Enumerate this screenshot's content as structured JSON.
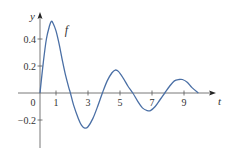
{
  "chart_data": {
    "type": "line",
    "title": "",
    "xlabel": "t",
    "ylabel": "y",
    "xlim": [
      -1.4,
      11.2
    ],
    "ylim": [
      -0.36,
      0.6
    ],
    "grid": false,
    "legend": null,
    "x_ticks": [
      1,
      3,
      5,
      7,
      9
    ],
    "x_tick_labels": [
      "1",
      "3",
      "5",
      "7",
      "9"
    ],
    "y_ticks": [
      0.4,
      0.2,
      -0.2
    ],
    "y_tick_labels": [
      "0.4",
      "0.2",
      "−0.2"
    ],
    "origin_label": "0",
    "series": [
      {
        "name": "f",
        "color": "#4a6fa5",
        "x": [
          0,
          0.2,
          0.4,
          0.6,
          0.7,
          0.8,
          1.0,
          1.2,
          1.4,
          1.6,
          1.8,
          1.9,
          2.1,
          2.4,
          2.6,
          2.8,
          3.0,
          3.3,
          3.6,
          3.9,
          4.2,
          4.5,
          4.7,
          4.9,
          5.2,
          5.5,
          5.8,
          6.1,
          6.4,
          6.7,
          6.9,
          7.2,
          7.5,
          7.8,
          8.1,
          8.4,
          8.7,
          8.9,
          9.2,
          9.5,
          9.9
        ],
        "y": [
          0,
          0.22,
          0.4,
          0.5,
          0.53,
          0.52,
          0.46,
          0.36,
          0.24,
          0.13,
          0.04,
          0,
          -0.09,
          -0.19,
          -0.24,
          -0.26,
          -0.25,
          -0.19,
          -0.1,
          0,
          0.09,
          0.15,
          0.17,
          0.16,
          0.11,
          0.05,
          0,
          -0.06,
          -0.11,
          -0.13,
          -0.13,
          -0.1,
          -0.05,
          0,
          0.05,
          0.09,
          0.1,
          0.1,
          0.08,
          0.04,
          0
        ]
      }
    ],
    "annotations": [
      {
        "text": "f",
        "x": 1.55,
        "y": 0.44
      }
    ]
  }
}
